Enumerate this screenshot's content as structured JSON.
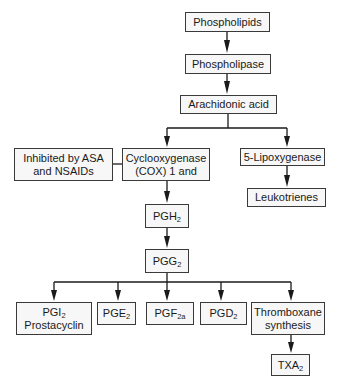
{
  "diagram": {
    "nodes": {
      "phospholipids": {
        "label": "Phospholipids"
      },
      "phospholipase": {
        "label": "Phospholipase"
      },
      "arachidonic_acid": {
        "label": "Arachidonic acid"
      },
      "inhibited": {
        "line1": "Inhibited by ASA",
        "line2": "and NSAIDs"
      },
      "cox": {
        "line1": "Cyclooxygenase",
        "line2": "(COX) 1 and"
      },
      "lipoxygenase": {
        "label": "5-Lipoxygenase"
      },
      "leukotrienes": {
        "label": "Leukotrienes"
      },
      "pgh2": {
        "base": "PGH",
        "sub": "2"
      },
      "pgg2": {
        "base": "PGG",
        "sub": "2"
      },
      "pgi2": {
        "base": "PGI",
        "sub": "2",
        "line2": "Prostacyclin"
      },
      "pge2": {
        "base": "PGE",
        "sub": "2"
      },
      "pgf2a": {
        "base": "PGF",
        "sub": "2a"
      },
      "pgd2": {
        "base": "PGD",
        "sub": "2"
      },
      "thromboxane": {
        "line1": "Thromboxane",
        "line2": "synthesis"
      },
      "txa2": {
        "base": "TXA",
        "sub": "2"
      }
    },
    "edges": [
      [
        "phospholipids",
        "phospholipase"
      ],
      [
        "phospholipase",
        "arachidonic_acid"
      ],
      [
        "arachidonic_acid",
        "cox"
      ],
      [
        "arachidonic_acid",
        "lipoxygenase"
      ],
      [
        "inhibited",
        "cox"
      ],
      [
        "lipoxygenase",
        "leukotrienes"
      ],
      [
        "cox",
        "pgh2"
      ],
      [
        "pgh2",
        "pgg2"
      ],
      [
        "pgg2",
        "pgi2"
      ],
      [
        "pgg2",
        "pge2"
      ],
      [
        "pgg2",
        "pgf2a"
      ],
      [
        "pgg2",
        "pgd2"
      ],
      [
        "pgg2",
        "thromboxane"
      ],
      [
        "thromboxane",
        "txa2"
      ]
    ]
  }
}
